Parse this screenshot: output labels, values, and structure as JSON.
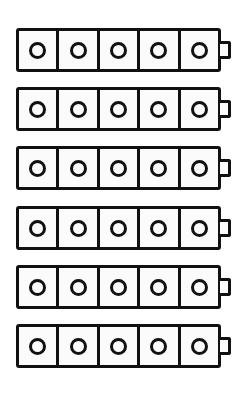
{
  "canvas": {
    "width": 248,
    "height": 395,
    "background_color": "#ffffff"
  },
  "figure": {
    "stroke_color": "#111111",
    "fill_color": "#fbfbfb",
    "row_count": 6,
    "cells_per_row": 5,
    "cell_marker": "circle-outline"
  },
  "rows": [
    {
      "id": "battery-row-1",
      "top": 28,
      "cells": [
        {
          "id": "r1c1",
          "marker": "circle-outline"
        },
        {
          "id": "r1c2",
          "marker": "circle-outline"
        },
        {
          "id": "r1c3",
          "marker": "circle-outline"
        },
        {
          "id": "r1c4",
          "marker": "circle-outline"
        },
        {
          "id": "r1c5",
          "marker": "circle-outline"
        }
      ],
      "terminal": "right-nub"
    },
    {
      "id": "battery-row-2",
      "top": 87,
      "cells": [
        {
          "id": "r2c1",
          "marker": "circle-outline"
        },
        {
          "id": "r2c2",
          "marker": "circle-outline"
        },
        {
          "id": "r2c3",
          "marker": "circle-outline"
        },
        {
          "id": "r2c4",
          "marker": "circle-outline"
        },
        {
          "id": "r2c5",
          "marker": "circle-outline"
        }
      ],
      "terminal": "right-nub"
    },
    {
      "id": "battery-row-3",
      "top": 146,
      "cells": [
        {
          "id": "r3c1",
          "marker": "circle-outline"
        },
        {
          "id": "r3c2",
          "marker": "circle-outline"
        },
        {
          "id": "r3c3",
          "marker": "circle-outline"
        },
        {
          "id": "r3c4",
          "marker": "circle-outline"
        },
        {
          "id": "r3c5",
          "marker": "circle-outline"
        }
      ],
      "terminal": "right-nub"
    },
    {
      "id": "battery-row-4",
      "top": 206,
      "cells": [
        {
          "id": "r4c1",
          "marker": "circle-outline"
        },
        {
          "id": "r4c2",
          "marker": "circle-outline"
        },
        {
          "id": "r4c3",
          "marker": "circle-outline"
        },
        {
          "id": "r4c4",
          "marker": "circle-outline"
        },
        {
          "id": "r4c5",
          "marker": "circle-outline"
        }
      ],
      "terminal": "right-nub"
    },
    {
      "id": "battery-row-5",
      "top": 265,
      "cells": [
        {
          "id": "r5c1",
          "marker": "circle-outline"
        },
        {
          "id": "r5c2",
          "marker": "circle-outline"
        },
        {
          "id": "r5c3",
          "marker": "circle-outline"
        },
        {
          "id": "r5c4",
          "marker": "circle-outline"
        },
        {
          "id": "r5c5",
          "marker": "circle-outline"
        }
      ],
      "terminal": "right-nub"
    },
    {
      "id": "battery-row-6",
      "top": 324,
      "cells": [
        {
          "id": "r6c1",
          "marker": "circle-outline"
        },
        {
          "id": "r6c2",
          "marker": "circle-outline"
        },
        {
          "id": "r6c3",
          "marker": "circle-outline"
        },
        {
          "id": "r6c4",
          "marker": "circle-outline"
        },
        {
          "id": "r6c5",
          "marker": "circle-outline"
        }
      ],
      "terminal": "right-nub"
    }
  ]
}
